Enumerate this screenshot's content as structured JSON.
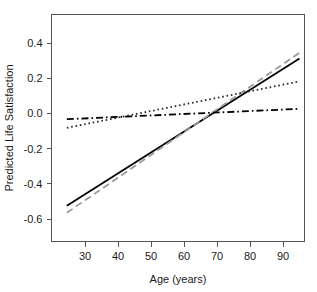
{
  "chart_data": {
    "type": "line",
    "title": "",
    "xlabel": "Age (years)",
    "ylabel": "Predicted Life Satisfaction",
    "xlim": [
      24,
      96
    ],
    "ylim": [
      -0.68,
      0.48
    ],
    "xticks": [
      30,
      40,
      50,
      60,
      70,
      80,
      90
    ],
    "xtick_labels": [
      "30",
      "40",
      "50",
      "60",
      "70",
      "80",
      "90"
    ],
    "yticks": [
      0.4,
      0.2,
      0.0,
      -0.2,
      -0.4,
      -0.6
    ],
    "ytick_labels": [
      "0.4",
      "0.2",
      "0.0",
      "-0.2",
      "-0.4",
      "-0.6"
    ],
    "grid": false,
    "legend": "none",
    "box": true,
    "series": [
      {
        "name": "solid-line",
        "style": "solid",
        "color": "#000000",
        "width": 1.8,
        "x": [
          24.5,
          95.0
        ],
        "y": [
          -0.525,
          0.312
        ]
      },
      {
        "name": "dashed-line",
        "style": "dashed",
        "color": "#9a9a9a",
        "width": 1.8,
        "x": [
          24.5,
          95.0
        ],
        "y": [
          -0.565,
          0.345
        ]
      },
      {
        "name": "dotted-line",
        "style": "dotted",
        "color": "#2a2a2a",
        "width": 1.8,
        "x": [
          24.5,
          95.0
        ],
        "y": [
          -0.082,
          0.182
        ]
      },
      {
        "name": "dash-dot-line",
        "style": "dashdot",
        "color": "#000000",
        "width": 1.8,
        "x": [
          24.5,
          95.0
        ],
        "y": [
          -0.033,
          0.026
        ]
      }
    ]
  },
  "axes": {
    "x_title": "Age (years)",
    "y_title": "Predicted Life Satisfaction",
    "x_labels": [
      "30",
      "40",
      "50",
      "60",
      "70",
      "80",
      "90"
    ],
    "y_labels": [
      "0.4",
      "0.2",
      "0.0",
      "-0.2",
      "-0.4",
      "-0.6"
    ]
  },
  "colors": {
    "background": "#ffffff",
    "axis": "#555555",
    "text": "#1a1a1a",
    "solid_series": "#000000",
    "dashed_series": "#9a9a9a",
    "dotted_series": "#2a2a2a",
    "dashdot_series": "#000000"
  }
}
